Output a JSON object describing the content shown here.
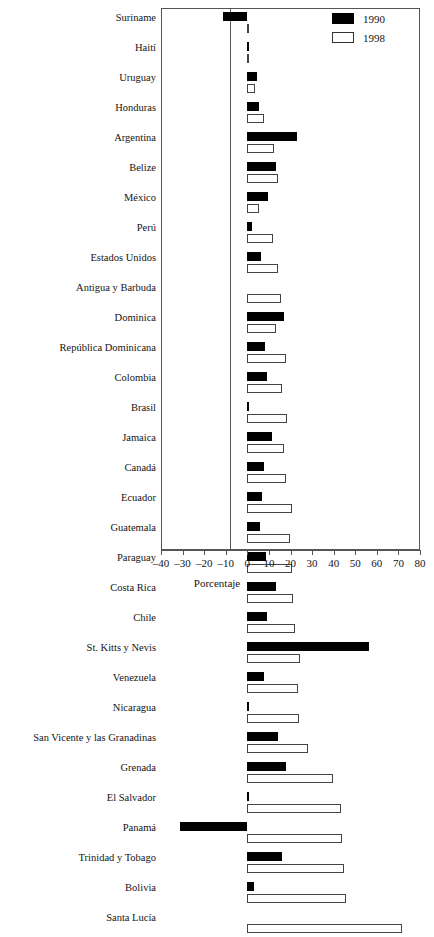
{
  "chart_data": {
    "type": "bar",
    "orientation": "horizontal",
    "title": "",
    "subtitle": "",
    "xlabel": "Porcentaje",
    "ylabel": "",
    "xlim": [
      -40,
      80
    ],
    "xticks": [
      -40,
      -30,
      -20,
      -10,
      0,
      10,
      20,
      30,
      40,
      50,
      60,
      70,
      80
    ],
    "xtick_labels": [
      "–40",
      "–30",
      "–20",
      "–10",
      "0",
      "10",
      "20",
      "30",
      "40",
      "50",
      "60",
      "70",
      "80"
    ],
    "grid": false,
    "legend_position": "top-right",
    "categories": [
      "Suriname",
      "Haití",
      "Uruguay",
      "Honduras",
      "Argentina",
      "Belize",
      "México",
      "Perú",
      "Estados Unidos",
      "Antigua y Barbuda",
      "Dominica",
      "República Dominicana",
      "Colombia",
      "Brasil",
      "Jamaica",
      "Canadá",
      "Ecuador",
      "Guatemala",
      "Paraguay",
      "Costa Rica",
      "Chile",
      "St. Kitts y Nevis",
      "Venezuela",
      "Nicaragua",
      "San Vicente y las Granadinas",
      "Grenada",
      "El Salvador",
      "Panamá",
      "Trinidad y Tobago",
      "Bolivia",
      "Santa Lucía"
    ],
    "series": [
      {
        "name": "1990",
        "color": "#000000",
        "values": [
          -11.5,
          0.8,
          4.5,
          5.5,
          23.0,
          13.5,
          9.5,
          2.0,
          6.5,
          0.0,
          17.0,
          8.0,
          9.0,
          0.5,
          11.5,
          7.5,
          7.0,
          6.0,
          8.5,
          13.5,
          9.0,
          56.5,
          7.5,
          0.5,
          14.0,
          18.0,
          0.8,
          -31.0,
          16.0,
          3.0,
          0.0
        ]
      },
      {
        "name": "1998",
        "color": "#ffffff",
        "values": [
          0.6,
          1.0,
          3.5,
          7.5,
          12.5,
          14.0,
          5.5,
          12.0,
          14.0,
          15.5,
          13.5,
          18.0,
          16.0,
          18.5,
          17.0,
          18.0,
          20.5,
          20.0,
          20.5,
          21.0,
          22.0,
          24.5,
          23.5,
          24.0,
          28.0,
          39.5,
          43.5,
          44.0,
          45.0,
          45.5,
          71.5
        ]
      }
    ]
  },
  "legend": {
    "items": [
      {
        "label": "1990",
        "color": "#000000"
      },
      {
        "label": "1998",
        "color": "#ffffff"
      }
    ]
  },
  "axis": {
    "x_title": "Porcentaje"
  }
}
